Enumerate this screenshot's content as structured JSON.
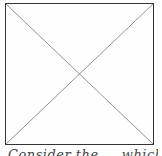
{
  "image_placeholder": {
    "icon": "broken-image-x-placeholder",
    "border_color": "#333333",
    "line_color": "#777777"
  },
  "caption": {
    "text": "Consider the ... which"
  }
}
